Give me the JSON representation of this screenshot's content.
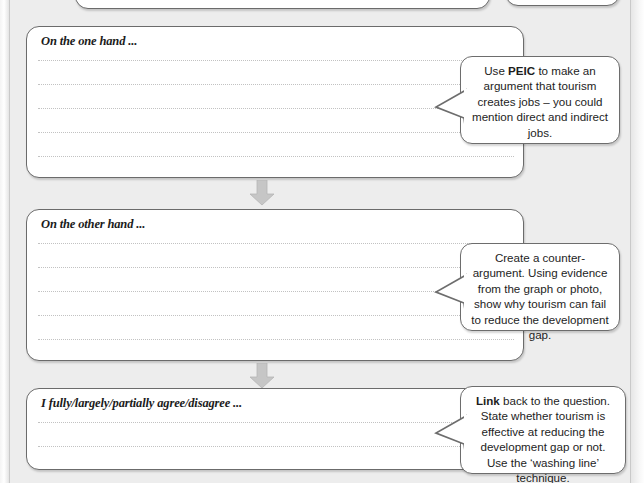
{
  "page": {
    "background_color": "#ededec",
    "frame_border_color": "#6b6b6b",
    "rule_color": "#c2c2c2",
    "arrow_color": "#bdbdbd"
  },
  "top_partial_boxes": [
    {
      "name": "partial-box-wide"
    },
    {
      "name": "partial-box-narrow"
    }
  ],
  "sections": [
    {
      "id": "one-hand",
      "title": "On the one hand ...",
      "rule_count": 5
    },
    {
      "id": "other-hand",
      "title": "On the other hand ...",
      "rule_count": 5
    },
    {
      "id": "conclusion",
      "title": "I fully/largely/partially agree/disagree ...",
      "rule_count": 3
    }
  ],
  "connectors": [
    {
      "id": "arrow-1",
      "icon": "arrow-down-icon"
    },
    {
      "id": "arrow-2",
      "icon": "arrow-down-icon"
    }
  ],
  "bubbles": [
    {
      "id": "bubble-peic",
      "lead": "Use ",
      "bold": "PEIC",
      "rest": " to make an argument that tourism creates jobs – you could mention direct and indirect jobs.",
      "full_text": "Use PEIC to make an argument that tourism creates jobs – you could mention direct and indirect jobs."
    },
    {
      "id": "bubble-counter",
      "lead": "",
      "bold": "",
      "rest": "Create a counter-argument. Using evidence from the graph or photo, show why tourism can fail to reduce the development gap.",
      "full_text": "Create a counter-argument. Using evidence from the graph or photo, show why tourism can fail to reduce the development gap."
    },
    {
      "id": "bubble-link",
      "lead": "",
      "bold": "Link",
      "rest": " back to the question. State whether tourism is effective at reducing the development gap or not. Use the ‘washing line’ technique.",
      "full_text": "Link back to the question. State whether tourism is effective at reducing the development gap or not. Use the ‘washing line’ technique."
    }
  ]
}
